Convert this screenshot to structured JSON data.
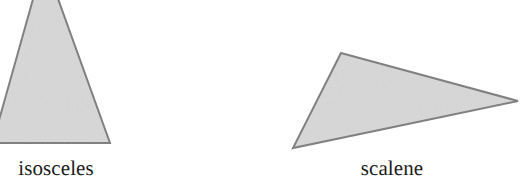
{
  "figure": {
    "background_color": "#ffffff",
    "width": 522,
    "height": 195,
    "fill_color": "#d8d8d8",
    "stroke_color": "#7a7a7a",
    "text_color": "#1b1b1b",
    "shapes": [
      {
        "name": "isosceles",
        "label": "isosceles",
        "type": "triangle",
        "cropped_at_top": true,
        "points": "-22,195 44,-40 110,143 -22,143"
      },
      {
        "name": "scalene",
        "label": "scalene",
        "type": "triangle",
        "cropped_at_top": false,
        "points": "341,53 518,101 293,148"
      }
    ]
  },
  "labels": {
    "isosceles": "isosceles",
    "scalene": "scalene"
  }
}
